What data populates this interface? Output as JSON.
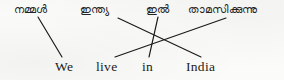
{
  "figure": {
    "kind": "word-order-matching-diagram",
    "width": 284,
    "height": 80,
    "background_color": "#fbfbf9",
    "line_color": "#1a1a1a"
  },
  "source_row": {
    "language": "Malayalam",
    "sentence": "നമ്മൾ ഇന്ത്യ ഇൽ താമസിക്കുന്നു",
    "words": [
      {
        "text": "നമ്മൾ",
        "x": 14,
        "anchor_x": 38,
        "anchor_y": 17
      },
      {
        "text": "ഇന്ത്യ",
        "x": 80,
        "anchor_x": 118,
        "anchor_y": 18
      },
      {
        "text": "ഇൽ",
        "x": 146,
        "anchor_x": 158,
        "anchor_y": 17
      },
      {
        "text": "താമസിക്കുന്നു",
        "x": 188,
        "anchor_x": 226,
        "anchor_y": 18
      }
    ]
  },
  "target_row": {
    "language": "English",
    "sentence": "We live in India",
    "words": [
      {
        "text": "We",
        "x": 55,
        "anchor_x": 62,
        "anchor_y": 57
      },
      {
        "text": "live",
        "x": 96,
        "anchor_x": 115,
        "anchor_y": 57
      },
      {
        "text": "in",
        "x": 142,
        "anchor_x": 149,
        "anchor_y": 57
      },
      {
        "text": "India",
        "x": 186,
        "anchor_x": 201,
        "anchor_y": 57
      }
    ]
  },
  "crossing_point": {
    "x": 132,
    "y": 43
  },
  "links": [
    {
      "from": "നമ്മൾ",
      "to": "We",
      "x1": 38,
      "y1": 17,
      "x2": 62,
      "y2": 57
    },
    {
      "from": "ഇന്ത്യ",
      "to": "India",
      "x1": 118,
      "y1": 18,
      "x2": 201,
      "y2": 57
    },
    {
      "from": "ഇൽ",
      "to": "in",
      "x1": 158,
      "y1": 17,
      "x2": 149,
      "y2": 57
    },
    {
      "from": "താമസിക്കുന്നു",
      "to": "live",
      "x1": 226,
      "y1": 18,
      "x2": 115,
      "y2": 57
    }
  ]
}
